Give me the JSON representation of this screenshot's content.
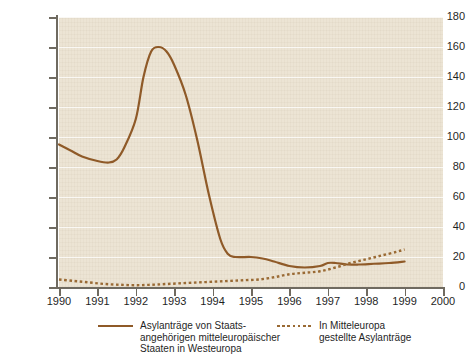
{
  "chart_data": {
    "type": "line",
    "title": "",
    "xlabel": "",
    "ylabel": "Tausend",
    "xlim": [
      1990,
      2000
    ],
    "ylim": [
      0,
      180
    ],
    "grid": true,
    "legend_position": "bottom",
    "x_ticks": [
      "1990",
      "1991",
      "1992",
      "1993",
      "1994",
      "1995",
      "1996",
      "1997",
      "1998",
      "1999",
      "2000"
    ],
    "y_ticks": [
      "0",
      "20",
      "40",
      "60",
      "80",
      "100",
      "120",
      "140",
      "160",
      "180"
    ],
    "series": [
      {
        "name": "Asylanträge von Staats-\nangehörigen mitteleuropäischer\nStaaten in Westeuropa",
        "style": "solid",
        "color": "#8f5a28",
        "x": [
          1990.0,
          1990.3,
          1990.6,
          1991.0,
          1991.3,
          1991.5,
          1991.7,
          1992.0,
          1992.2,
          1992.4,
          1992.6,
          1992.8,
          1993.0,
          1993.3,
          1993.6,
          1993.9,
          1994.2,
          1994.4,
          1994.6,
          1995.0,
          1995.3,
          1995.6,
          1996.0,
          1996.4,
          1996.8,
          1997.0,
          1997.2,
          1997.5,
          1997.8,
          1998.2,
          1998.6,
          1999.0
        ],
        "y": [
          95,
          91,
          87,
          84,
          83,
          85,
          93,
          112,
          140,
          157,
          160,
          157,
          148,
          128,
          98,
          62,
          32,
          22,
          20,
          20,
          19,
          17,
          14,
          13,
          14,
          16,
          16,
          15,
          15,
          15.5,
          16,
          17
        ]
      },
      {
        "name": "In Mitteleuropa\ngestellte Asylanträge",
        "style": "dotted",
        "color": "#9a6a34",
        "x": [
          1990.0,
          1990.4,
          1990.8,
          1991.2,
          1991.6,
          1992.0,
          1992.4,
          1992.8,
          1993.2,
          1993.6,
          1994.0,
          1994.4,
          1994.8,
          1995.2,
          1995.6,
          1996.0,
          1996.4,
          1996.8,
          1997.2,
          1997.6,
          1998.0,
          1998.4,
          1998.8,
          1999.0
        ],
        "y": [
          5,
          4,
          3,
          2,
          1.5,
          1.2,
          1.5,
          2,
          2.5,
          3,
          3.5,
          4,
          4.5,
          5,
          6.5,
          8.5,
          9.5,
          10.5,
          13,
          16,
          18.5,
          21,
          23.5,
          25
        ]
      }
    ]
  },
  "legend": [
    {
      "swatch": "solid-line-swatch",
      "label": "Asylanträge von Staats-\nangehörigen mitteleuropäischer\nStaaten in Westeuropa"
    },
    {
      "swatch": "dotted-line-swatch",
      "label": "In Mitteleuropa\ngestellte Asylanträge"
    }
  ]
}
